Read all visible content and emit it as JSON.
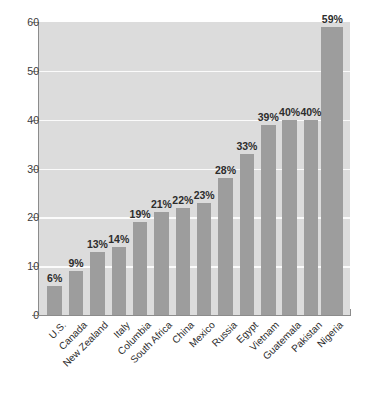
{
  "chart_data": {
    "type": "bar",
    "title": "",
    "subtitle": "",
    "xlabel": "",
    "ylabel": "",
    "ylim": [
      0,
      60
    ],
    "yticks": [
      0,
      10,
      20,
      30,
      40,
      50,
      60
    ],
    "ytick_labels": [
      "0",
      "10",
      "20",
      "30",
      "40",
      "50",
      "60"
    ],
    "grid": true,
    "gridlines_at": [
      10,
      20,
      30,
      40,
      50
    ],
    "legend": null,
    "legend_position": "none",
    "orientation": "vertical",
    "categories": [
      "U.S.",
      "Canada",
      "New Zealand",
      "Italy",
      "Columbia",
      "South Africa",
      "China",
      "Mexico",
      "Russia",
      "Egypt",
      "Vietnam",
      "Guatemala",
      "Pakistan",
      "Nigeria"
    ],
    "values": [
      6,
      9,
      13,
      14,
      19,
      21,
      22,
      23,
      28,
      33,
      39,
      40,
      40,
      59
    ],
    "data_labels": [
      "6%",
      "9%",
      "13%",
      "14%",
      "19%",
      "21%",
      "22%",
      "23%",
      "28%",
      "33%",
      "39%",
      "40%",
      "40%",
      "59%"
    ],
    "colors": {
      "bar": "#9d9d9d",
      "plot_background": "#dcdcdc",
      "page_background": "#ffffff",
      "gridline": "#fbfbfb",
      "axis": "#8c8c8c",
      "text": "#2d2d2d"
    }
  }
}
